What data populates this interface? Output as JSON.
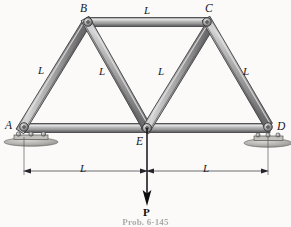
{
  "figure": {
    "caption": "Prob. 6-145",
    "joint_labels": {
      "a": "A",
      "b": "B",
      "c": "C",
      "d": "D",
      "e": "E"
    },
    "member_labels": {
      "ab": "L",
      "bc": "L",
      "be": "L",
      "ce": "L",
      "cd": "L"
    },
    "dimension_labels": {
      "left": "L",
      "right": "L"
    },
    "load_label": "P",
    "colors": {
      "member_fill": "#a9a9a9",
      "member_highlight": "#d8d8d8",
      "member_shadow": "#6f6f71",
      "outline": "#3a3a3c",
      "background": "#fbfaf8",
      "support": "#b6b4b0",
      "load_arrow": "#0d0d10",
      "dimension_line": "#4a4a4e",
      "text": "#16161a"
    },
    "geometry": {
      "joints": {
        "a": [
          22,
          128
        ],
        "b": [
          87,
          22
        ],
        "c": [
          208,
          22
        ],
        "d": [
          270,
          128
        ],
        "e": [
          147,
          128
        ]
      },
      "members": [
        "A-B",
        "B-C",
        "B-E",
        "C-E",
        "C-D",
        "A-E",
        "E-D"
      ]
    }
  }
}
